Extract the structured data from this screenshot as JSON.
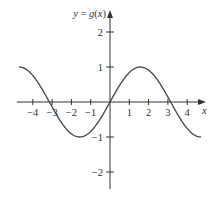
{
  "chart_data": {
    "type": "line",
    "title": "",
    "function_label": "y = g(x)",
    "xlabel": "x",
    "ylabel": "y = g(x)",
    "xlim": [
      -4.85,
      5.0
    ],
    "ylim": [
      -2.45,
      2.6
    ],
    "x_ticks": [
      -4,
      -3,
      -2,
      -1,
      1,
      2,
      3,
      4
    ],
    "x_tick_labels": [
      "−4",
      "−3",
      "−2",
      "−1",
      "1",
      "2",
      "3",
      "4"
    ],
    "y_ticks": [
      2,
      1,
      -1,
      -2
    ],
    "y_tick_labels": [
      "2",
      "1",
      "−1",
      "−2"
    ],
    "grid": false,
    "legend": null,
    "series": [
      {
        "name": "g(x)",
        "description": "sine curve, g(x) = sin(x) on [-3π/2, 3π/2]",
        "x": [
          -4.712,
          -3.927,
          -3.142,
          -2.356,
          -1.571,
          -0.785,
          0,
          0.785,
          1.571,
          2.356,
          3.142,
          3.927,
          4.712
        ],
        "y": [
          1,
          0.707,
          0,
          -0.707,
          -1,
          -0.707,
          0,
          0.707,
          1,
          0.707,
          0,
          -0.707,
          -1
        ]
      }
    ],
    "key_points": {
      "zeros": [
        -3.14,
        0,
        3.14
      ],
      "maxima": [
        [
          -4.71,
          1
        ],
        [
          1.57,
          1
        ]
      ],
      "minima": [
        [
          -1.57,
          -1
        ],
        [
          4.71,
          -1
        ]
      ]
    }
  },
  "colors": {
    "axis": "#333333",
    "curve": "#444444",
    "text": "#333333"
  },
  "geometry": {
    "origin_x": 110,
    "origin_y": 102,
    "x_scale": 19.3,
    "y_scale": 35,
    "x_axis_left": 17,
    "x_axis_right": 206,
    "y_axis_bottom": 189,
    "y_axis_top": 10
  }
}
